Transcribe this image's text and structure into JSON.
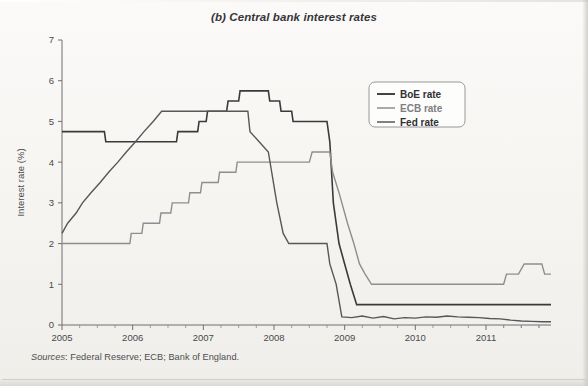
{
  "figure": {
    "title": "(b) Central bank interest rates",
    "source_label": "Sources",
    "source_text": ": Federal Reserve; ECB; Bank of England."
  },
  "colors": {
    "boe": "#3a3a3d",
    "ecb": "#8e8e91",
    "fed": "#575759",
    "axis": "#6f6f72",
    "text": "#3b3b3b",
    "background": "#f7f6f4"
  },
  "chart_data": {
    "type": "line",
    "title": "(b) Central bank interest rates",
    "xlabel": "",
    "ylabel": "Interest rate (%)",
    "xlim": [
      2005,
      2011.92
    ],
    "ylim": [
      0,
      7
    ],
    "yticks": [
      0,
      1,
      2,
      3,
      4,
      5,
      6,
      7
    ],
    "xticks": [
      2005,
      2006,
      2007,
      2008,
      2009,
      2010,
      2011
    ],
    "xtick_labels": [
      "2005",
      "2006",
      "2007",
      "2008",
      "2009",
      "2010",
      "2011"
    ],
    "minor_xticks_per_year": 4,
    "grid": false,
    "legend_position": "upper right",
    "step_style": "post",
    "series": [
      {
        "name": "BoE rate",
        "color": "#3a3a3d",
        "width": 1.6,
        "points": [
          [
            2005.0,
            4.75
          ],
          [
            2005.6,
            4.75
          ],
          [
            2005.62,
            4.5
          ],
          [
            2006.62,
            4.5
          ],
          [
            2006.64,
            4.75
          ],
          [
            2006.92,
            4.75
          ],
          [
            2006.94,
            5.0
          ],
          [
            2007.04,
            5.0
          ],
          [
            2007.06,
            5.25
          ],
          [
            2007.33,
            5.25
          ],
          [
            2007.35,
            5.5
          ],
          [
            2007.5,
            5.5
          ],
          [
            2007.52,
            5.75
          ],
          [
            2007.92,
            5.75
          ],
          [
            2007.94,
            5.5
          ],
          [
            2008.08,
            5.5
          ],
          [
            2008.1,
            5.25
          ],
          [
            2008.25,
            5.25
          ],
          [
            2008.27,
            5.0
          ],
          [
            2008.75,
            5.0
          ],
          [
            2008.79,
            4.5
          ],
          [
            2008.84,
            3.0
          ],
          [
            2008.92,
            2.0
          ],
          [
            2009.0,
            1.5
          ],
          [
            2009.08,
            1.0
          ],
          [
            2009.17,
            0.5
          ],
          [
            2011.92,
            0.5
          ]
        ]
      },
      {
        "name": "ECB rate",
        "color": "#8e8e91",
        "width": 1.4,
        "points": [
          [
            2005.0,
            2.0
          ],
          [
            2005.96,
            2.0
          ],
          [
            2005.98,
            2.25
          ],
          [
            2006.13,
            2.25
          ],
          [
            2006.15,
            2.5
          ],
          [
            2006.38,
            2.5
          ],
          [
            2006.4,
            2.75
          ],
          [
            2006.54,
            2.75
          ],
          [
            2006.56,
            3.0
          ],
          [
            2006.79,
            3.0
          ],
          [
            2006.81,
            3.25
          ],
          [
            2006.96,
            3.25
          ],
          [
            2006.98,
            3.5
          ],
          [
            2007.21,
            3.5
          ],
          [
            2007.23,
            3.75
          ],
          [
            2007.46,
            3.75
          ],
          [
            2007.48,
            4.0
          ],
          [
            2008.5,
            4.0
          ],
          [
            2008.54,
            4.25
          ],
          [
            2008.79,
            4.25
          ],
          [
            2008.83,
            3.75
          ],
          [
            2008.92,
            3.25
          ],
          [
            2009.04,
            2.5
          ],
          [
            2009.13,
            2.0
          ],
          [
            2009.21,
            1.5
          ],
          [
            2009.29,
            1.25
          ],
          [
            2009.38,
            1.0
          ],
          [
            2011.25,
            1.0
          ],
          [
            2011.29,
            1.25
          ],
          [
            2011.46,
            1.25
          ],
          [
            2011.54,
            1.5
          ],
          [
            2011.79,
            1.5
          ],
          [
            2011.83,
            1.25
          ],
          [
            2011.92,
            1.25
          ]
        ]
      },
      {
        "name": "Fed rate",
        "color": "#575759",
        "width": 1.4,
        "points": [
          [
            2005.0,
            2.25
          ],
          [
            2005.08,
            2.5
          ],
          [
            2005.2,
            2.75
          ],
          [
            2005.29,
            3.0
          ],
          [
            2005.41,
            3.25
          ],
          [
            2005.54,
            3.5
          ],
          [
            2005.66,
            3.75
          ],
          [
            2005.79,
            4.0
          ],
          [
            2005.91,
            4.25
          ],
          [
            2006.04,
            4.5
          ],
          [
            2006.16,
            4.75
          ],
          [
            2006.29,
            5.0
          ],
          [
            2006.41,
            5.25
          ],
          [
            2007.63,
            5.25
          ],
          [
            2007.66,
            4.75
          ],
          [
            2007.79,
            4.5
          ],
          [
            2007.92,
            4.25
          ],
          [
            2008.04,
            3.0
          ],
          [
            2008.13,
            2.25
          ],
          [
            2008.21,
            2.0
          ],
          [
            2008.75,
            2.0
          ],
          [
            2008.79,
            1.5
          ],
          [
            2008.88,
            1.0
          ],
          [
            2008.96,
            0.2
          ],
          [
            2009.1,
            0.18
          ],
          [
            2009.25,
            0.22
          ],
          [
            2009.4,
            0.17
          ],
          [
            2009.55,
            0.21
          ],
          [
            2009.7,
            0.15
          ],
          [
            2009.85,
            0.18
          ],
          [
            2010.0,
            0.17
          ],
          [
            2010.15,
            0.2
          ],
          [
            2010.3,
            0.19
          ],
          [
            2010.45,
            0.22
          ],
          [
            2010.6,
            0.2
          ],
          [
            2010.75,
            0.19
          ],
          [
            2010.9,
            0.18
          ],
          [
            2011.05,
            0.16
          ],
          [
            2011.2,
            0.15
          ],
          [
            2011.35,
            0.12
          ],
          [
            2011.5,
            0.1
          ],
          [
            2011.65,
            0.09
          ],
          [
            2011.8,
            0.08
          ],
          [
            2011.92,
            0.08
          ]
        ]
      }
    ]
  },
  "legend": {
    "items": [
      {
        "label": "BoE rate",
        "color": "#3a3a3d",
        "muted": false
      },
      {
        "label": "ECB rate",
        "color": "#8e8e91",
        "muted": true
      },
      {
        "label": "Fed rate",
        "color": "#575759",
        "muted": false
      }
    ]
  }
}
